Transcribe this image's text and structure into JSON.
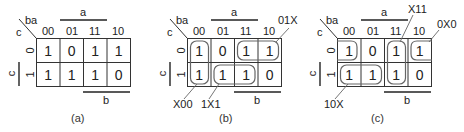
{
  "diagrams": [
    {
      "id": "a",
      "caption": "(a)",
      "corner_col_var": "ba",
      "corner_row_var": "c",
      "col_headers": [
        "00",
        "01",
        "11",
        "10"
      ],
      "row_headers": [
        "0",
        "1"
      ],
      "top_bar_label": "a",
      "bottom_bar_label": "b",
      "side_bar_label": "c",
      "cells": [
        [
          "1",
          "0",
          "1",
          "1"
        ],
        [
          "1",
          "1",
          "1",
          "0"
        ]
      ],
      "groups": []
    },
    {
      "id": "b",
      "caption": "(b)",
      "corner_col_var": "ba",
      "corner_row_var": "c",
      "col_headers": [
        "00",
        "01",
        "11",
        "10"
      ],
      "row_headers": [
        "0",
        "1"
      ],
      "top_bar_label": "a",
      "bottom_bar_label": "b",
      "side_bar_label": "c",
      "cells": [
        [
          "1",
          "0",
          "1",
          "1"
        ],
        [
          "1",
          "1",
          "1",
          "0"
        ]
      ],
      "groups": [
        {
          "label": "X00",
          "cells": "col 00, rows 0-1"
        },
        {
          "label": "1X1",
          "cells": "row 1, cols 01-11"
        },
        {
          "label": "01X",
          "cells": "row 0, cols 11-10"
        }
      ]
    },
    {
      "id": "c",
      "caption": "(c)",
      "corner_col_var": "ba",
      "corner_row_var": "c",
      "col_headers": [
        "00",
        "01",
        "11",
        "10"
      ],
      "row_headers": [
        "0",
        "1"
      ],
      "top_bar_label": "a",
      "bottom_bar_label": "b",
      "side_bar_label": "c",
      "cells": [
        [
          "1",
          "0",
          "1",
          "1"
        ],
        [
          "1",
          "1",
          "1",
          "0"
        ]
      ],
      "groups": [
        {
          "label": "10X",
          "cells": "row 1, cols 00-01"
        },
        {
          "label": "X11",
          "cells": "col 11, rows 0-1"
        },
        {
          "label": "0X0",
          "cells": "row 0, cols 10 and 00 (wrap-around)"
        }
      ]
    }
  ],
  "colors": {
    "grid": "#333333",
    "group_outline": "#666666",
    "text": "#222222"
  }
}
